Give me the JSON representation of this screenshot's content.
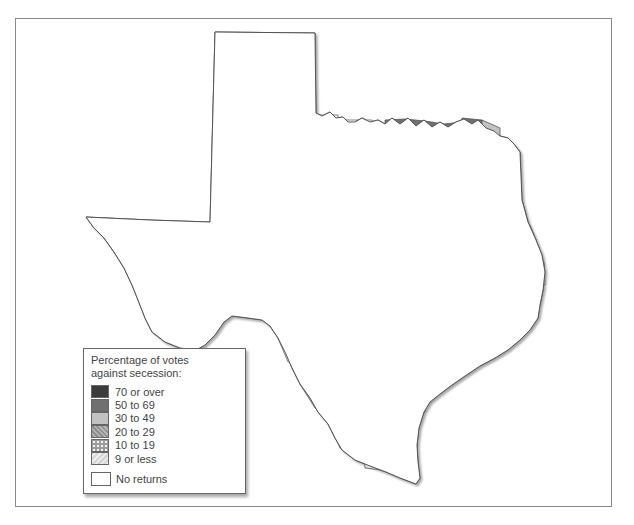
{
  "map": {
    "subject": "Texas counties",
    "legend": {
      "title_line1": "Percentage of votes",
      "title_line2": "against secession:",
      "categories": [
        {
          "key": "c70",
          "label": "70 or over",
          "color": "#3b3b3b",
          "pattern": "solid"
        },
        {
          "key": "c50",
          "label": "50 to 69",
          "color": "#707070",
          "pattern": "solid"
        },
        {
          "key": "c30",
          "label": "30 to 49",
          "color": "#c2c2c2",
          "pattern": "solid"
        },
        {
          "key": "c20",
          "label": "20 to 29",
          "color": "#a9a9a9",
          "pattern": "diagonal-hatch"
        },
        {
          "key": "c10",
          "label": "10 to 19",
          "color": "#9c9c9c",
          "pattern": "dots"
        },
        {
          "key": "c0",
          "label": "9 or less",
          "color": "#d6d6d6",
          "pattern": "light-hatch"
        }
      ],
      "no_returns": {
        "key": "none",
        "label": "No returns",
        "color": "#ffffff"
      }
    }
  }
}
